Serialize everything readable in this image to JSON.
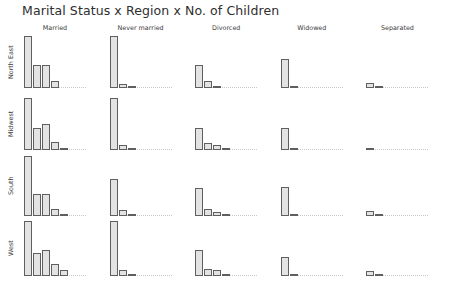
{
  "chart": {
    "title": "Marital Status x Region x No. of Children"
  },
  "chart_data": {
    "type": "bar",
    "title": "Marital Status x Region x No. of Children",
    "xlabel": "",
    "ylabel": "",
    "grid": false,
    "legend": "none",
    "layout": "trellis 4 rows (Region) x 5 columns (Marital Status)",
    "categories": [
      "0",
      "1",
      "2",
      "3",
      "4"
    ],
    "category_label": "No. of Children",
    "columns": [
      "Married",
      "Never married",
      "Divorced",
      "Widowed",
      "Separated"
    ],
    "rows": [
      "North East",
      "Midwest",
      "South",
      "West"
    ],
    "ylim": [
      0,
      100
    ],
    "panels": [
      {
        "row": "North East",
        "column": "Married",
        "values": [
          100,
          44,
          44,
          14,
          0
        ]
      },
      {
        "row": "North East",
        "column": "Never married",
        "values": [
          100,
          8,
          2,
          0,
          0
        ]
      },
      {
        "row": "North East",
        "column": "Divorced",
        "values": [
          44,
          14,
          3,
          0,
          0
        ]
      },
      {
        "row": "North East",
        "column": "Widowed",
        "values": [
          56,
          3,
          0,
          0,
          0
        ]
      },
      {
        "row": "North East",
        "column": "Separated",
        "values": [
          10,
          2,
          0,
          0,
          0
        ]
      },
      {
        "row": "Midwest",
        "column": "Married",
        "values": [
          100,
          42,
          50,
          16,
          4
        ]
      },
      {
        "row": "Midwest",
        "column": "Never married",
        "values": [
          100,
          10,
          3,
          0,
          0
        ]
      },
      {
        "row": "Midwest",
        "column": "Divorced",
        "values": [
          42,
          13,
          9,
          2,
          0
        ]
      },
      {
        "row": "Midwest",
        "column": "Widowed",
        "values": [
          42,
          2,
          0,
          0,
          0
        ]
      },
      {
        "row": "Midwest",
        "column": "Separated",
        "values": [
          4,
          0,
          0,
          0,
          0
        ]
      },
      {
        "row": "South",
        "column": "Married",
        "values": [
          100,
          36,
          37,
          12,
          2
        ]
      },
      {
        "row": "South",
        "column": "Never married",
        "values": [
          62,
          10,
          3,
          0,
          0
        ]
      },
      {
        "row": "South",
        "column": "Divorced",
        "values": [
          46,
          12,
          6,
          2,
          0
        ]
      },
      {
        "row": "South",
        "column": "Widowed",
        "values": [
          48,
          3,
          0,
          0,
          0
        ]
      },
      {
        "row": "South",
        "column": "Separated",
        "values": [
          9,
          2,
          0,
          0,
          0
        ]
      },
      {
        "row": "West",
        "column": "Married",
        "values": [
          100,
          42,
          48,
          22,
          10
        ]
      },
      {
        "row": "West",
        "column": "Never married",
        "values": [
          100,
          10,
          3,
          0,
          0
        ]
      },
      {
        "row": "West",
        "column": "Divorced",
        "values": [
          48,
          12,
          10,
          2,
          0
        ]
      },
      {
        "row": "West",
        "column": "Widowed",
        "values": [
          34,
          2,
          0,
          0,
          0
        ]
      },
      {
        "row": "West",
        "column": "Separated",
        "values": [
          9,
          2,
          0,
          0,
          0
        ]
      }
    ]
  },
  "style": {
    "bar_fill": "#e3e3e3",
    "bar_border": "#5f5f5f",
    "baseline": "#c9c9c9",
    "text": "#3c3c3c",
    "background": "#ffffff"
  }
}
